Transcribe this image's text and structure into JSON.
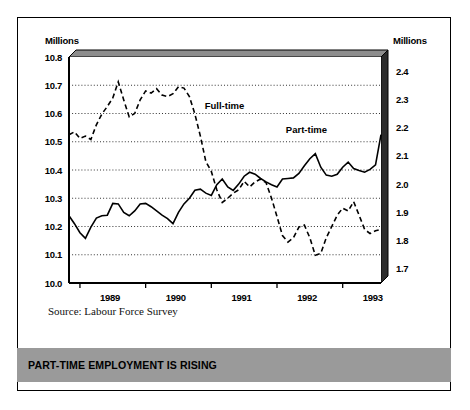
{
  "banner": {
    "text": "PART-TIME EMPLOYMENT IS RISING"
  },
  "source": {
    "text": "Source: Labour Force Survey"
  },
  "axis_titles": {
    "left": "Millions",
    "right": "Millions"
  },
  "chart_data": {
    "type": "line",
    "title": "",
    "xlabel": "",
    "ylabel": "Millions",
    "grid": true,
    "legend": "inline-annotations",
    "left_axis": {
      "label": "Millions",
      "ylim": [
        10.0,
        10.8
      ],
      "ticks": [
        "10.0",
        "10.1",
        "10.2",
        "10.3",
        "10.4",
        "10.5",
        "10.6",
        "10.7",
        "10.8"
      ],
      "series": "Full-time"
    },
    "right_axis": {
      "label": "Millions",
      "ylim": [
        1.65,
        2.45
      ],
      "ticks": [
        "1.7",
        "1.8",
        "1.9",
        "2.0",
        "2.1",
        "2.2",
        "2.3",
        "2.4"
      ],
      "series": "Part-time"
    },
    "xtick_labels": [
      "1989",
      "1990",
      "1991",
      "1992",
      "1993"
    ],
    "annotations": [
      {
        "text": "Full-time",
        "x_frac": 0.435,
        "value": 10.63
      },
      {
        "text": "Part-time",
        "x_frac": 0.695,
        "value": 10.545
      }
    ],
    "series": [
      {
        "name": "Full-time",
        "style": "dashed",
        "axis": "left",
        "units": "millions",
        "values": [
          10.525,
          10.535,
          10.512,
          10.52,
          10.508,
          10.56,
          10.598,
          10.625,
          10.655,
          10.712,
          10.648,
          10.588,
          10.6,
          10.648,
          10.68,
          10.672,
          10.688,
          10.665,
          10.66,
          10.67,
          10.695,
          10.69,
          10.66,
          10.598,
          10.52,
          10.43,
          10.395,
          10.33,
          10.285,
          10.3,
          10.318,
          10.33,
          10.36,
          10.34,
          10.358,
          10.368,
          10.355,
          10.3,
          10.235,
          10.168,
          10.145,
          10.16,
          10.198,
          10.205,
          10.16,
          10.098,
          10.105,
          10.16,
          10.2,
          10.24,
          10.265,
          10.255,
          10.288,
          10.24,
          10.19,
          10.175,
          10.185,
          10.19
        ]
      },
      {
        "name": "Part-time",
        "style": "solid",
        "axis": "right",
        "units": "millions",
        "values": [
          1.888,
          1.86,
          1.828,
          1.808,
          1.848,
          1.88,
          1.888,
          1.89,
          1.932,
          1.93,
          1.9,
          1.888,
          1.905,
          1.93,
          1.932,
          1.92,
          1.905,
          1.89,
          1.878,
          1.86,
          1.9,
          1.93,
          1.95,
          1.978,
          1.982,
          1.968,
          1.96,
          1.998,
          2.018,
          1.99,
          1.978,
          2.0,
          2.028,
          2.042,
          2.035,
          2.02,
          2.008,
          1.998,
          1.99,
          2.018,
          2.02,
          2.022,
          2.038,
          2.065,
          2.09,
          2.108,
          2.06,
          2.032,
          2.028,
          2.035,
          2.06,
          2.078,
          2.055,
          2.048,
          2.042,
          2.052,
          2.068,
          2.175
        ]
      }
    ]
  }
}
